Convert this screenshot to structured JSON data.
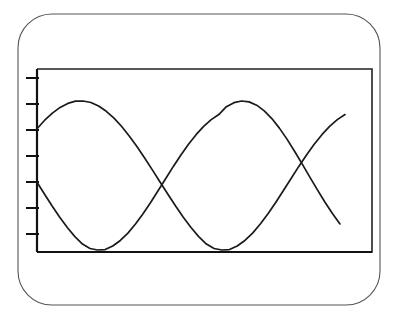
{
  "figure": {
    "title": "",
    "background_color": "#ffffff",
    "line_color": "#1a1a1a",
    "frame_color": "#222222",
    "card_border_color": "#555555"
  },
  "card": {
    "name": "rounded-card-frame",
    "x": 18,
    "y": 14,
    "width": 362,
    "height": 291,
    "corner_radius": 34,
    "stroke_width": 1.1
  },
  "plot": {
    "left": 37,
    "top": 69,
    "right": 372,
    "bottom": 252,
    "frame_stroke_width": 1.6,
    "axis_stroke_width": 2.2
  },
  "y_axis": {
    "name": "y-axis",
    "tick_count": 7,
    "tick_length": 11,
    "tick_positions_px": [
      78,
      104,
      130,
      156,
      182,
      208,
      234
    ],
    "tick_labels": [
      "",
      "",
      "",
      "",
      "",
      "",
      ""
    ],
    "label": ""
  },
  "x_axis": {
    "name": "x-axis",
    "tick_count": 0,
    "tick_labels": [],
    "label": ""
  },
  "chart_data": {
    "type": "line",
    "title": "",
    "subtitle": "",
    "xlabel": "",
    "ylabel": "",
    "xlim": [
      0,
      1
    ],
    "ylim": [
      0,
      1
    ],
    "grid": false,
    "legend": false,
    "legend_position": "none",
    "annotations": [],
    "x_tick_labels": [],
    "y_tick_labels": [],
    "series": [
      {
        "name": "curve-a",
        "amplitude": 0.42,
        "period_px": 211,
        "phase_deg": 90,
        "baseline_y": 0.5,
        "start_x_px": 37,
        "end_x_px": 345,
        "start_y_px": 103,
        "end_y_px": 125,
        "peaks_px": [
          [
            95,
            100
          ],
          [
            313,
            103
          ]
        ],
        "troughs_px": [
          [
            201,
            250
          ]
        ],
        "x": [
          0.0,
          0.025,
          0.05,
          0.075,
          0.1,
          0.125,
          0.15,
          0.175,
          0.2,
          0.225,
          0.25,
          0.275,
          0.3,
          0.325,
          0.35,
          0.375,
          0.4,
          0.425,
          0.45,
          0.475,
          0.5,
          0.525,
          0.55,
          0.575,
          0.6,
          0.625,
          0.65,
          0.675,
          0.7,
          0.725,
          0.75,
          0.775,
          0.8,
          0.825,
          0.85,
          0.875,
          0.9,
          0.925,
          0.95,
          0.975,
          1.0
        ],
        "y": [
          0.814,
          0.871,
          0.919,
          0.957,
          0.984,
          0.999,
          1.0,
          0.99,
          0.966,
          0.931,
          0.885,
          0.829,
          0.764,
          0.693,
          0.616,
          0.536,
          0.455,
          0.374,
          0.295,
          0.22,
          0.151,
          0.09,
          0.04,
          0.01,
          0.0,
          0.003,
          0.027,
          0.064,
          0.113,
          0.174,
          0.243,
          0.319,
          0.399,
          0.48,
          0.561,
          0.638,
          0.71,
          0.774,
          0.83,
          0.875,
          0.909
        ]
      },
      {
        "name": "curve-b",
        "amplitude": 0.42,
        "period_px": 211,
        "phase_deg": -35,
        "baseline_y": 0.5,
        "start_x_px": 37,
        "end_x_px": 340,
        "start_y_px": 170,
        "end_y_px": 238,
        "peaks_px": [
          [
            250,
            101
          ]
        ],
        "troughs_px": [
          [
            144,
            250
          ],
          [
            356,
            250
          ]
        ],
        "x": [
          0.0,
          0.025,
          0.05,
          0.075,
          0.1,
          0.125,
          0.15,
          0.175,
          0.2,
          0.225,
          0.25,
          0.275,
          0.3,
          0.325,
          0.35,
          0.375,
          0.4,
          0.425,
          0.45,
          0.475,
          0.5,
          0.525,
          0.55,
          0.575,
          0.6,
          0.625,
          0.65,
          0.675,
          0.7,
          0.725,
          0.75,
          0.775,
          0.8,
          0.825,
          0.85,
          0.875,
          0.9,
          0.925,
          0.95,
          0.975,
          1.0
        ],
        "y": [
          0.455,
          0.374,
          0.295,
          0.22,
          0.151,
          0.09,
          0.04,
          0.01,
          0.0,
          0.003,
          0.027,
          0.064,
          0.113,
          0.174,
          0.243,
          0.319,
          0.399,
          0.48,
          0.561,
          0.638,
          0.71,
          0.774,
          0.83,
          0.875,
          0.909,
          0.962,
          0.989,
          1.0,
          0.994,
          0.972,
          0.934,
          0.882,
          0.818,
          0.744,
          0.663,
          0.578,
          0.491,
          0.405,
          0.322,
          0.245,
          0.175
        ]
      }
    ],
    "crossings_px": [
      [
        64,
        124
      ],
      [
        174,
        228
      ],
      [
        286,
        124
      ]
    ]
  }
}
